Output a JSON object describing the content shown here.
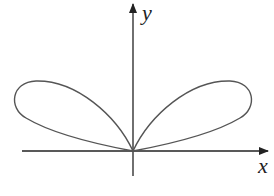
{
  "figure": {
    "type": "polar-curve-plot",
    "axes": {
      "x_label": "x",
      "y_label": "y",
      "origin_px": [
        133,
        151
      ]
    },
    "stroke_color": "#555555",
    "axis_color": "#222222"
  }
}
